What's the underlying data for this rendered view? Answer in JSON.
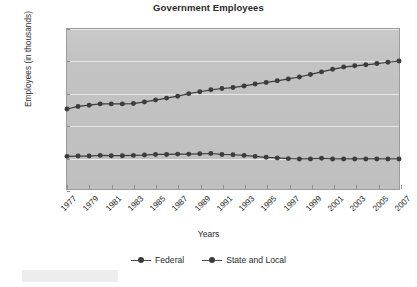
{
  "chart_data": {
    "type": "line",
    "title": "Government Employees",
    "xlabel": "Years",
    "ylabel": "Employees (in thousands)",
    "xlim": [
      1977,
      2007
    ],
    "ylim": [
      0,
      25000
    ],
    "grid": true,
    "legend_position": "bottom",
    "y_ticks": [
      "0",
      "5,000",
      "10,000",
      "15,000",
      "20,000",
      "25,000"
    ],
    "y_tick_values": [
      0,
      5000,
      10000,
      15000,
      20000,
      25000
    ],
    "x_tick_labels": [
      "1977",
      "1979",
      "1981",
      "1983",
      "1985",
      "1987",
      "1989",
      "1991",
      "1993",
      "1995",
      "1997",
      "1999",
      "2001",
      "2003",
      "2005",
      "2007"
    ],
    "x": [
      1977,
      1978,
      1979,
      1980,
      1981,
      1982,
      1983,
      1984,
      1985,
      1986,
      1987,
      1988,
      1989,
      1990,
      1991,
      1992,
      1993,
      1994,
      1995,
      1996,
      1997,
      1998,
      1999,
      2000,
      2001,
      2002,
      2003,
      2004,
      2005,
      2006,
      2007
    ],
    "series": [
      {
        "name": "Federal",
        "color": "#3c3c3c",
        "values": [
          5100,
          5150,
          5150,
          5250,
          5200,
          5200,
          5250,
          5300,
          5400,
          5400,
          5450,
          5450,
          5500,
          5550,
          5400,
          5350,
          5250,
          5100,
          4950,
          4850,
          4750,
          4700,
          4700,
          4800,
          4700,
          4700,
          4700,
          4700,
          4700,
          4700,
          4700
        ]
      },
      {
        "name": "State and Local",
        "color": "#3c3c3c",
        "values": [
          12500,
          12900,
          13100,
          13300,
          13300,
          13300,
          13350,
          13600,
          13900,
          14200,
          14500,
          14900,
          15200,
          15500,
          15700,
          15850,
          16100,
          16400,
          16650,
          16900,
          17200,
          17500,
          17900,
          18300,
          18700,
          19050,
          19250,
          19400,
          19600,
          19800,
          20000
        ]
      }
    ]
  },
  "legend": {
    "items": [
      {
        "label": "Federal"
      },
      {
        "label": "State and Local"
      }
    ]
  }
}
